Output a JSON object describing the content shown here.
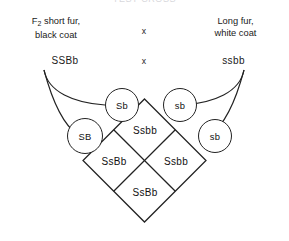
{
  "figure": {
    "cut_off_header": "TEST CROSS",
    "cross_symbol_top": "x",
    "cross_symbol_bottom": "x"
  },
  "parents": {
    "left": {
      "phenotype_line1": "F2 short fur,",
      "phenotype_line2": "black coat",
      "genotype": "SSBb"
    },
    "right": {
      "phenotype_line1": "Long fur,",
      "phenotype_line2": "white coat",
      "genotype": "ssbb"
    }
  },
  "gametes": [
    {
      "id": "gamete-Sb",
      "label": "Sb"
    },
    {
      "id": "gamete-sb-upper",
      "label": "sb"
    },
    {
      "id": "gamete-SB",
      "label": "SB"
    },
    {
      "id": "gamete-sb-lower",
      "label": "sb"
    }
  ],
  "punnett_square": {
    "type": "diamond",
    "cells": [
      {
        "position": "top",
        "genotype": "Ssbb"
      },
      {
        "position": "left",
        "genotype": "SsBb"
      },
      {
        "position": "right",
        "genotype": "Ssbb"
      },
      {
        "position": "bottom",
        "genotype": "SsBb"
      }
    ]
  },
  "style": {
    "line_color": "#222222",
    "text_color": "#1a1a1a",
    "background": "#ffffff"
  }
}
